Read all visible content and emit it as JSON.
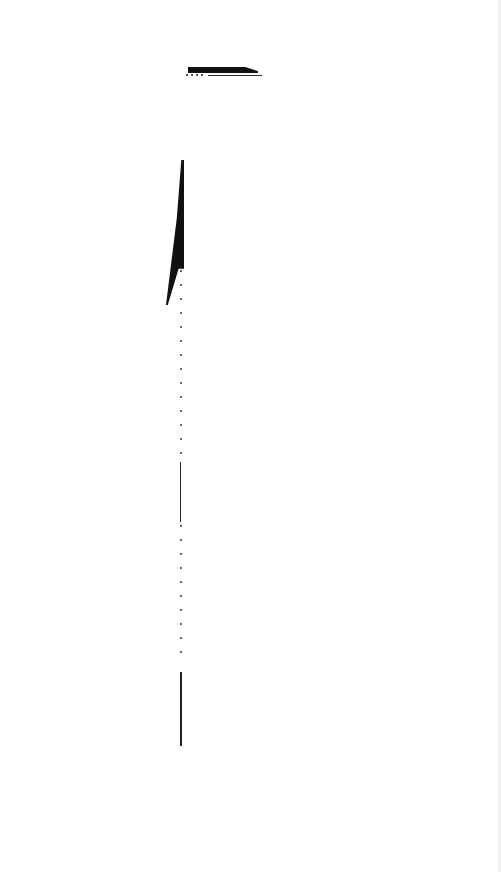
{
  "page": {
    "background": "#ffffff",
    "ink_color": "#111111"
  }
}
